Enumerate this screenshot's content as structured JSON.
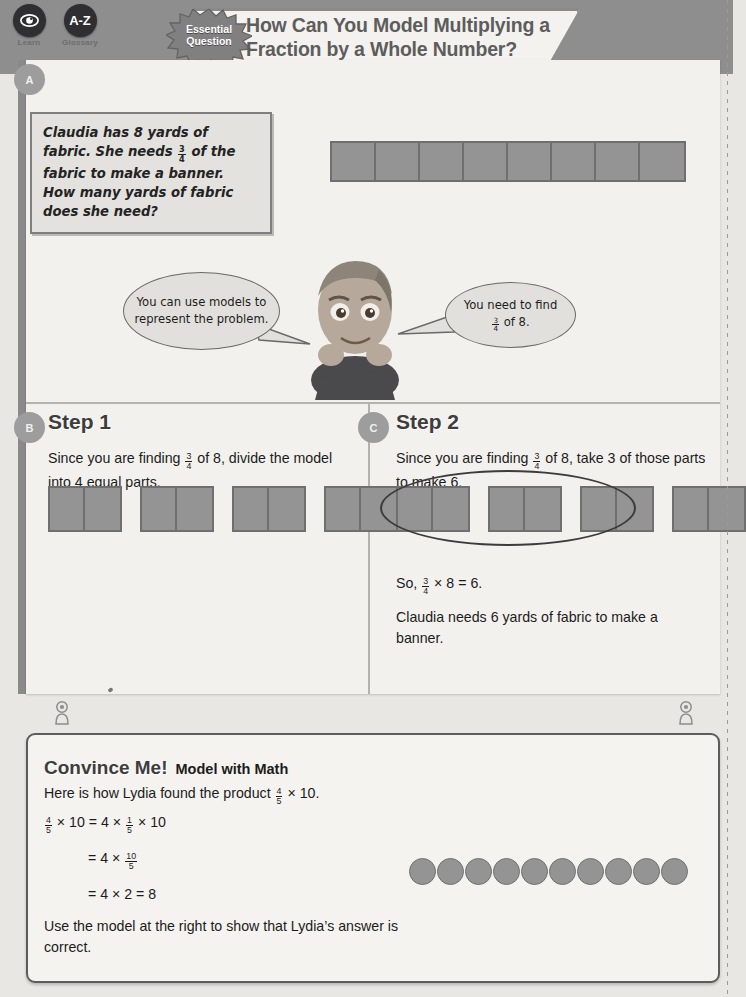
{
  "toolbar": {
    "tools": [
      {
        "icon": "learn-eye-icon",
        "glyph": "◉",
        "label": "Learn"
      },
      {
        "icon": "glossary-az-icon",
        "glyph": "A-Z",
        "label": "Glossary"
      }
    ]
  },
  "header": {
    "badge_line1": "Essential",
    "badge_line2": "Question",
    "title": "How Can You Model Multiplying a Fraction by a Whole Number?"
  },
  "sections": {
    "a_badge": "A",
    "b_badge": "B",
    "c_badge": "C"
  },
  "problem": {
    "text_part1": "Claudia has 8 yards of fabric. She needs ",
    "fraction_num": "3",
    "fraction_den": "4",
    "text_part2": " of the fabric to make a banner. How many yards of fabric does she need?"
  },
  "top_model": {
    "cells": 8,
    "label": "eight-cell-bar-model"
  },
  "bubbles": {
    "left": "You can use models to represent the problem.",
    "right_line1": "You need to find",
    "right_frac_num": "3",
    "right_frac_den": "4",
    "right_line2": " of 8."
  },
  "step1": {
    "title": "Step 1",
    "text_a": "Since you are finding ",
    "frac_num": "3",
    "frac_den": "4",
    "text_b": " of 8, divide the model into 4 equal parts.",
    "groups": 4,
    "cells_per_group": 2
  },
  "step2": {
    "title": "Step 2",
    "text_a": "Since you are finding ",
    "frac_num": "3",
    "frac_den": "4",
    "text_b": " of 8, take 3 of those parts to make 6.",
    "groups": 4,
    "cells_per_group": 2,
    "circled_groups": 3,
    "equation_prefix": "So, ",
    "equation_num": "3",
    "equation_den": "4",
    "equation_suffix": " × 8 = 6.",
    "conclusion": "Claudia needs 6 yards of fabric to make a banner."
  },
  "convince_me": {
    "title": "Convince Me!",
    "subtitle": "Model with Math",
    "intro_a": "Here is how Lydia found the product ",
    "intro_num": "4",
    "intro_den": "5",
    "intro_b": " × 10.",
    "eq1_num": "4",
    "eq1_den": "5",
    "eq1_mid": " × 10 = 4 × ",
    "eq1_num2": "1",
    "eq1_den2": "5",
    "eq1_end": " × 10",
    "eq2_prefix": "= 4 × ",
    "eq2_num": "10",
    "eq2_den": "5",
    "eq3": "= 4 × 2 = 8",
    "closing": "Use the model at the right to show that Lydia’s answer is correct.",
    "circles": 10
  },
  "colors": {
    "band": "#8e8e8e",
    "panel": "#f3f1ee",
    "model_fill": "#949494",
    "model_stroke": "#6f6f6f",
    "badge": "#9d9d9d"
  }
}
